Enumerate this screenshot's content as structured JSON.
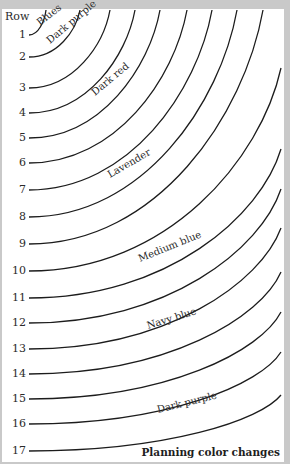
{
  "header": {
    "row_label": "Row"
  },
  "caption": "Planning color changes",
  "rows": [
    {
      "n": "1",
      "y": 35,
      "end": [
        46,
        10
      ]
    },
    {
      "n": "2",
      "y": 57,
      "end": [
        80,
        10
      ]
    },
    {
      "n": "3",
      "y": 88,
      "end": [
        110,
        10
      ]
    },
    {
      "n": "4",
      "y": 113,
      "end": [
        135,
        10
      ]
    },
    {
      "n": "5",
      "y": 138,
      "end": [
        160,
        10
      ]
    },
    {
      "n": "6",
      "y": 163,
      "end": [
        187,
        10
      ]
    },
    {
      "n": "7",
      "y": 190,
      "end": [
        212,
        10
      ]
    },
    {
      "n": "8",
      "y": 217,
      "end": [
        237,
        10
      ]
    },
    {
      "n": "9",
      "y": 244,
      "end": [
        263,
        10
      ]
    },
    {
      "n": "10",
      "y": 271,
      "end": [
        281,
        68
      ]
    },
    {
      "n": "11",
      "y": 298,
      "end": [
        281,
        149
      ]
    },
    {
      "n": "12",
      "y": 323,
      "end": [
        281,
        189
      ]
    },
    {
      "n": "13",
      "y": 349,
      "end": [
        281,
        228
      ]
    },
    {
      "n": "14",
      "y": 374,
      "end": [
        281,
        272
      ]
    },
    {
      "n": "15",
      "y": 399,
      "end": [
        281,
        312
      ]
    },
    {
      "n": "16",
      "y": 424,
      "end": [
        281,
        352
      ]
    },
    {
      "n": "17",
      "y": 451,
      "end": [
        281,
        395
      ]
    }
  ],
  "bands": [
    {
      "label": "Blues",
      "x": 40,
      "y": 26,
      "rotate": -38
    },
    {
      "label": "Dark purple",
      "x": 50,
      "y": 44,
      "rotate": -40
    },
    {
      "label": "Dark red",
      "x": 95,
      "y": 96,
      "rotate": -40
    },
    {
      "label": "Lavender",
      "x": 110,
      "y": 178,
      "rotate": -30
    },
    {
      "label": "Medium blue",
      "x": 140,
      "y": 262,
      "rotate": -22
    },
    {
      "label": "Navy blue",
      "x": 148,
      "y": 329,
      "rotate": -17
    },
    {
      "label": "Dark purple",
      "x": 158,
      "y": 413,
      "rotate": -14
    }
  ]
}
